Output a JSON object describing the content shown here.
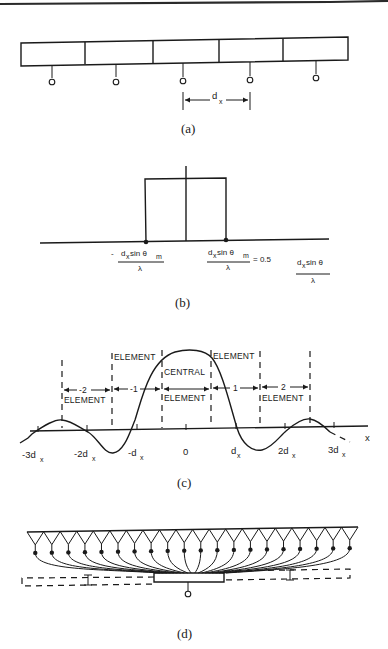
{
  "figure": {
    "top_rule_color": "#2a2a2a",
    "ink_color": "#1a1a1a",
    "background": "#ffffff"
  },
  "panel_a": {
    "caption": "(a)",
    "element_count": 5,
    "feed_count": 5,
    "spacing_label": "d",
    "spacing_subscript": "x"
  },
  "panel_b": {
    "caption": "(b)",
    "left_label": {
      "prefix": "-",
      "num_main": "d",
      "num_sub": "x",
      "num_mid": " sin θ",
      "num_sub2": "m",
      "den": "λ"
    },
    "right_label": {
      "num_main": "d",
      "num_sub": "x",
      "num_mid": " sin θ",
      "num_sub2": "m",
      "den": "λ",
      "suffix": "= 0.5"
    },
    "axis_label": {
      "num_main": "d",
      "num_sub": "x",
      "num_mid": " sin θ",
      "den": "λ"
    }
  },
  "panel_c": {
    "caption": "(c)",
    "axis_var": "x",
    "ticks": [
      {
        "main": "-3d",
        "sub": "x"
      },
      {
        "main": "-2d",
        "sub": "x"
      },
      {
        "main": "-d",
        "sub": "x"
      },
      {
        "main": "0",
        "sub": ""
      },
      {
        "main": "d",
        "sub": "x"
      },
      {
        "main": "2d",
        "sub": "x"
      },
      {
        "main": "3d",
        "sub": "x"
      }
    ],
    "regions": {
      "m2_num": "-2",
      "m1_num": "-1",
      "p1_num": "1",
      "p2_num": "2",
      "word_element": "ELEMENT",
      "word_central": "CENTRAL"
    }
  },
  "panel_d": {
    "caption": "(d)",
    "horn_count": 20
  }
}
